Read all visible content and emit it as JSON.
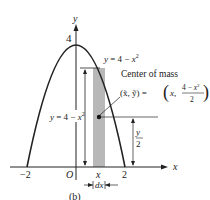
{
  "figure": {
    "caption": "(b)",
    "axes": {
      "x_label": "x",
      "y_label": "y",
      "origin_label": "O",
      "x_ticks": [
        "−2",
        "2"
      ],
      "y_ticks": [
        "4"
      ],
      "strip_x_label": "x",
      "strip_width_label": "dx"
    },
    "curve": {
      "equation_label": "y = 4 − x",
      "equation_exp": "2"
    },
    "height_annotation": {
      "label": "y = 4 − x",
      "exp": "2"
    },
    "centroid": {
      "title": "Center of mass",
      "coords_lhs": "(x̃, ỹ) =",
      "coords_x": "x,",
      "coords_num": "4 − x",
      "coords_num_exp": "2",
      "coords_den": "2"
    },
    "half_height": {
      "num": "y",
      "den": "2"
    },
    "colors": {
      "strip": "#b8b8b8",
      "ink": "#222222"
    }
  }
}
